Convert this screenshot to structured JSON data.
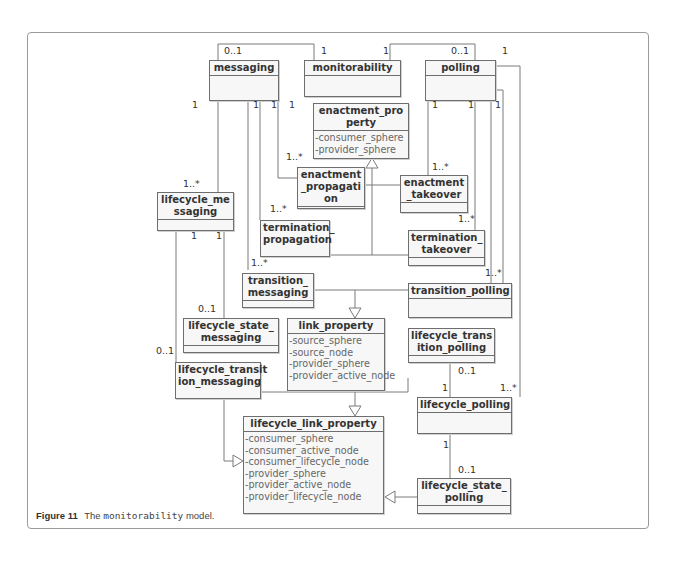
{
  "figure": {
    "label": "Figure 11",
    "caption_prefix": "The",
    "caption_code": "monitorability",
    "caption_suffix": "model."
  },
  "classes": {
    "messaging": {
      "name": "messaging",
      "attributes": []
    },
    "monitorability": {
      "name": "monitorability",
      "attributes": []
    },
    "polling": {
      "name": "polling",
      "attributes": []
    },
    "enactment_property": {
      "name": "enactment_pro\nperty",
      "attributes": [
        "-consumer_sphere",
        "-provider_sphere"
      ]
    },
    "enactment_propagation": {
      "name": "enactment\n_propagati\non",
      "attributes": []
    },
    "enactment_takeover": {
      "name": "enactment\n_takeover",
      "attributes": []
    },
    "lifecycle_messaging": {
      "name": "lifecycle_me\nssaging",
      "attributes": []
    },
    "termination_propagation": {
      "name": "termination_\npropagation",
      "attributes": []
    },
    "termination_takeover": {
      "name": "termination_\ntakeover",
      "attributes": []
    },
    "transition_messaging": {
      "name": "transition_\nmessaging",
      "attributes": []
    },
    "transition_polling": {
      "name": "transition_polling",
      "attributes": []
    },
    "link_property": {
      "name": "link_property",
      "attributes": [
        "-source_sphere",
        "-source_node",
        "-provider_sphere",
        "-provider_active_node"
      ]
    },
    "lifecycle_state_messaging": {
      "name": "lifecycle_state_\nmessaging",
      "attributes": []
    },
    "lifecycle_transition_polling": {
      "name": "lifecycle_trans\nition_polling",
      "attributes": []
    },
    "lifecycle_transition_messaging": {
      "name": "lifecycle_transit\nion_messaging",
      "attributes": []
    },
    "lifecycle_polling": {
      "name": "lifecycle_polling",
      "attributes": []
    },
    "lifecycle_link_property": {
      "name": "lifecycle_link_property",
      "attributes": [
        "-consumer_sphere",
        "-consumer_active_node",
        "-consumer_lifecycle_node",
        "-provider_sphere",
        "-provider_active_node",
        "-provider_lifecycle_node"
      ]
    },
    "lifecycle_state_polling": {
      "name": "lifecycle_state_\npolling",
      "attributes": []
    }
  },
  "multiplicities": [
    {
      "text": "0..1",
      "x": 224,
      "y": 46
    },
    {
      "text": "1",
      "x": 321,
      "y": 46
    },
    {
      "text": "1",
      "x": 383,
      "y": 46
    },
    {
      "text": "0..1",
      "x": 451,
      "y": 46
    },
    {
      "text": "1",
      "x": 502,
      "y": 46
    },
    {
      "text": "1",
      "x": 192,
      "y": 100
    },
    {
      "text": "1",
      "x": 253,
      "y": 100
    },
    {
      "text": "1",
      "x": 271,
      "y": 100
    },
    {
      "text": "1",
      "x": 289,
      "y": 100
    },
    {
      "text": "1",
      "x": 432,
      "y": 100
    },
    {
      "text": "1",
      "x": 468,
      "y": 100
    },
    {
      "text": "1",
      "x": 495,
      "y": 100
    },
    {
      "text": "1..*",
      "x": 286,
      "y": 152
    },
    {
      "text": "1..*",
      "x": 432,
      "y": 162
    },
    {
      "text": "1..*",
      "x": 183,
      "y": 179
    },
    {
      "text": "1..*",
      "x": 270,
      "y": 204
    },
    {
      "text": "1..*",
      "x": 458,
      "y": 214
    },
    {
      "text": "1",
      "x": 191,
      "y": 231
    },
    {
      "text": "1",
      "x": 216,
      "y": 231
    },
    {
      "text": "1..*",
      "x": 251,
      "y": 258
    },
    {
      "text": "1..*",
      "x": 485,
      "y": 268
    },
    {
      "text": "0..1",
      "x": 198,
      "y": 304
    },
    {
      "text": "0..1",
      "x": 156,
      "y": 346
    },
    {
      "text": "0..1",
      "x": 458,
      "y": 366
    },
    {
      "text": "1",
      "x": 442,
      "y": 383
    },
    {
      "text": "1..*",
      "x": 500,
      "y": 383
    },
    {
      "text": "1",
      "x": 443,
      "y": 440
    },
    {
      "text": "0..1",
      "x": 458,
      "y": 465
    }
  ]
}
